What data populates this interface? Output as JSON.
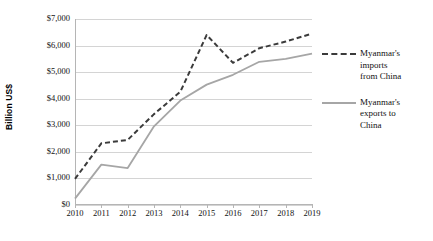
{
  "chart_data": {
    "type": "line",
    "title": "",
    "xlabel": "",
    "ylabel": "Billion US$",
    "categories": [
      "2010",
      "2011",
      "2012",
      "2013",
      "2014",
      "2015",
      "2016",
      "2017",
      "2018",
      "2019"
    ],
    "x": [
      2010,
      2011,
      2012,
      2013,
      2014,
      2015,
      2016,
      2017,
      2018,
      2019
    ],
    "ylim": [
      0,
      7000
    ],
    "yticks": [
      0,
      1000,
      2000,
      3000,
      4000,
      5000,
      6000,
      7000
    ],
    "ytick_labels": [
      "$0",
      "$1,000",
      "$2,000",
      "$3,000",
      "$4,000",
      "$5,000",
      "$6,000",
      "$7,000"
    ],
    "grid": true,
    "legend_position": "right",
    "series": [
      {
        "name": "Myanmar's imports from China",
        "style": "dashed",
        "color": "#3b3b3b",
        "values": [
          980,
          2320,
          2450,
          3420,
          4260,
          6400,
          5350,
          5900,
          6150,
          6450
        ]
      },
      {
        "name": "Myanmar's exports to China",
        "style": "solid",
        "color": "#a6a6a6",
        "values": [
          240,
          1520,
          1390,
          2960,
          3930,
          4530,
          4900,
          5390,
          5500,
          5700
        ]
      }
    ]
  },
  "legend": {
    "entries": [
      {
        "label_line1": "Myanmar's",
        "label_line2": "imports",
        "label_line3": "from China"
      },
      {
        "label_line1": "Myanmar's",
        "label_line2": "exports to",
        "label_line3": "China"
      }
    ]
  },
  "axis": {
    "y_title": "Billion US$"
  }
}
